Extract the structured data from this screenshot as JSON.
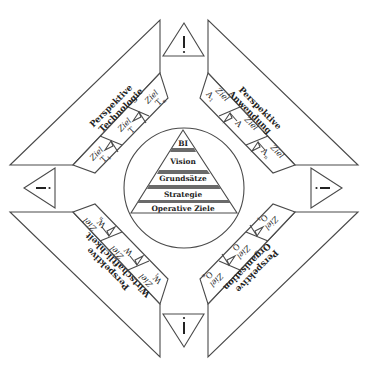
{
  "diagram": {
    "pyramid": {
      "levels": [
        "BI",
        "Vision",
        "Grundsätze",
        "Strategie",
        "Operative Ziele"
      ]
    },
    "perspectives": [
      {
        "id": "technologie",
        "line1": "Perspektive",
        "line2": "Technologie",
        "goals": [
          {
            "label": "Ziel",
            "symbol": "T",
            "sub": "1"
          },
          {
            "label": "Ziel",
            "symbol": "T",
            "sub": "..."
          },
          {
            "label": "Ziel",
            "symbol": "T",
            "sub": "n"
          }
        ]
      },
      {
        "id": "anwendung",
        "line1": "Perspektive",
        "line2": "Anwendung",
        "goals": [
          {
            "label": "Ziel",
            "symbol": "A",
            "sub": "1"
          },
          {
            "label": "Ziel",
            "symbol": "A",
            "sub": "..."
          },
          {
            "label": "Ziel",
            "symbol": "A",
            "sub": "n"
          }
        ]
      },
      {
        "id": "organisation",
        "line1": "Perspektive",
        "line2": "Organisation",
        "goals": [
          {
            "label": "Ziel",
            "symbol": "O",
            "sub": "1"
          },
          {
            "label": "Ziel",
            "symbol": "O",
            "sub": "..."
          },
          {
            "label": "Ziel",
            "symbol": "O",
            "sub": "n"
          }
        ]
      },
      {
        "id": "wirtschaftlichkeit",
        "line1": "Perspektive",
        "line2": "Wirtschaftlichkeit",
        "goals": [
          {
            "label": "Ziel",
            "symbol": "W",
            "sub": "1"
          },
          {
            "label": "Ziel",
            "symbol": "W",
            "sub": "..."
          },
          {
            "label": "Ziel",
            "symbol": "W",
            "sub": "n"
          }
        ]
      }
    ],
    "warning_signs": [
      {
        "position": "top",
        "glyph": "!"
      },
      {
        "position": "right",
        "glyph": "!"
      },
      {
        "position": "bottom",
        "glyph": "!"
      },
      {
        "position": "left",
        "glyph": "!"
      }
    ]
  }
}
